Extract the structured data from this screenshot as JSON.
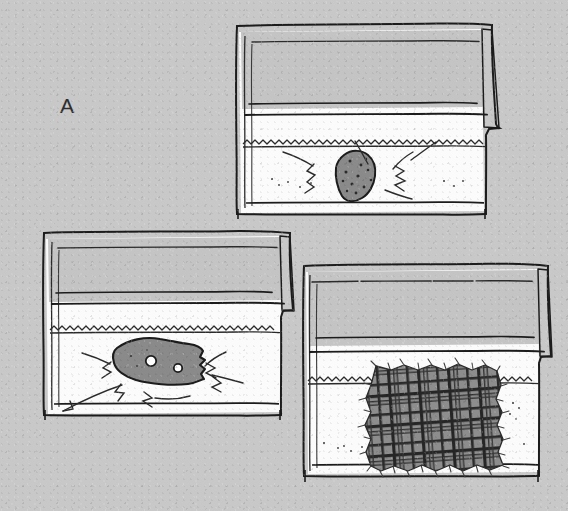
{
  "figure": {
    "panel_label": "A",
    "domain_note": "hand-drawn line illustration",
    "canvas": {
      "width": 568,
      "height": 511
    },
    "colors": {
      "background": "#c8c8c8",
      "ink": "#1c1c1c",
      "ink_light": "#3a3a3a",
      "bag_interior": "#fbfbfb",
      "bag_flap": "#c4c4c4",
      "specimen_fill": "#8a8a8a",
      "specimen_dark": "#2b2b2b",
      "hole_fill": "#ffffff",
      "label_color": "#2e2e2e"
    }
  },
  "panels": [
    {
      "id": "bag-top",
      "position": "top-center",
      "container": "resealable plastic bag",
      "specimen_name": "sponge",
      "specimen_description": "porous sponge fragment, speckled",
      "specimen_fill": "#8a8a8a",
      "has_impact_lines": true,
      "pore_count": 12,
      "bounds": {
        "x": 236,
        "y": 25,
        "width": 248,
        "height": 190
      }
    },
    {
      "id": "bag-left",
      "position": "bottom-left",
      "container": "resealable plastic bag",
      "specimen_name": "cheese-wedge",
      "specimen_description": "cheese wedge with two round holes",
      "specimen_fill": "#8a8a8a",
      "has_impact_lines": true,
      "hole_count": 2,
      "bounds": {
        "x": 40,
        "y": 233,
        "width": 244,
        "height": 187
      }
    },
    {
      "id": "bag-right",
      "position": "bottom-right",
      "container": "resealable plastic bag",
      "specimen_name": "plaid-fabric-swatch",
      "specimen_description": "square of tartan / plaid woven cloth with frayed edges",
      "specimen_fill": "#8a8a8a",
      "has_impact_lines": false,
      "bounds": {
        "x": 300,
        "y": 266,
        "width": 248,
        "height": 215
      }
    }
  ],
  "annotations": {
    "label_a": {
      "text": "A",
      "x": 60,
      "y": 113
    }
  }
}
